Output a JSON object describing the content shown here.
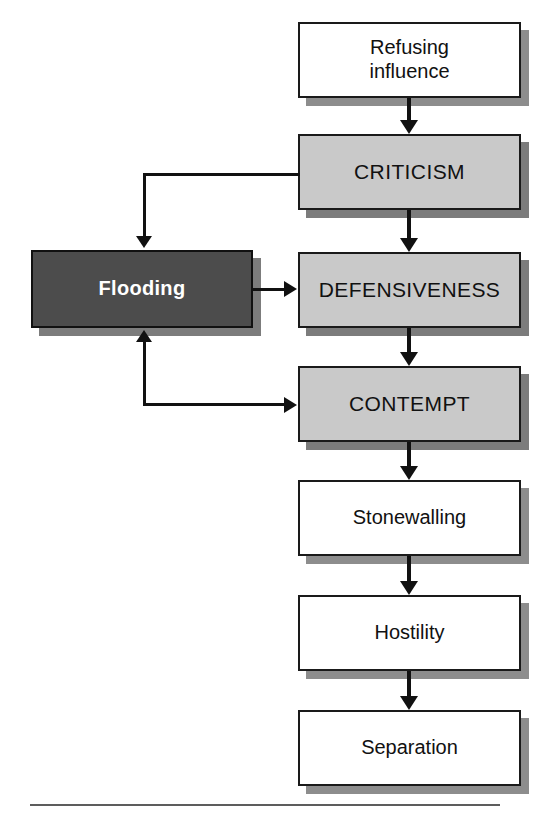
{
  "diagram": {
    "nodes": [
      {
        "id": "refusing-influence",
        "label": "Refusing\ninfluence",
        "style": "white",
        "x": 298,
        "y": 22,
        "w": 223,
        "h": 76
      },
      {
        "id": "criticism",
        "label": "CRITICISM",
        "style": "gray",
        "x": 298,
        "y": 134,
        "w": 223,
        "h": 76
      },
      {
        "id": "defensiveness",
        "label": "DEFENSIVENESS",
        "style": "gray",
        "x": 298,
        "y": 252,
        "w": 223,
        "h": 76
      },
      {
        "id": "contempt",
        "label": "CONTEMPT",
        "style": "gray",
        "x": 298,
        "y": 366,
        "w": 223,
        "h": 76
      },
      {
        "id": "stonewalling",
        "label": "Stonewalling",
        "style": "white",
        "x": 298,
        "y": 480,
        "w": 223,
        "h": 76
      },
      {
        "id": "hostility",
        "label": "Hostility",
        "style": "white",
        "x": 298,
        "y": 595,
        "w": 223,
        "h": 76
      },
      {
        "id": "separation",
        "label": "Separation",
        "style": "white",
        "x": 298,
        "y": 710,
        "w": 223,
        "h": 76
      },
      {
        "id": "flooding",
        "label": "Flooding",
        "style": "dark",
        "x": 31,
        "y": 250,
        "w": 222,
        "h": 78
      }
    ],
    "edges": [
      {
        "id": "refusing-to-criticism",
        "from": "refusing-influence",
        "to": "criticism",
        "kind": "down"
      },
      {
        "id": "criticism-to-defensiveness",
        "from": "criticism",
        "to": "defensiveness",
        "kind": "down"
      },
      {
        "id": "defensiveness-to-contempt",
        "from": "defensiveness",
        "to": "contempt",
        "kind": "down"
      },
      {
        "id": "contempt-to-stonewalling",
        "from": "contempt",
        "to": "stonewalling",
        "kind": "down"
      },
      {
        "id": "stonewalling-to-hostility",
        "from": "stonewalling",
        "to": "hostility",
        "kind": "down"
      },
      {
        "id": "hostility-to-separation",
        "from": "hostility",
        "to": "separation",
        "kind": "down"
      },
      {
        "id": "criticism-to-flooding",
        "from": "criticism",
        "to": "flooding",
        "kind": "elbow-left-down"
      },
      {
        "id": "flooding-to-defensiveness",
        "from": "flooding",
        "to": "defensiveness",
        "kind": "right"
      },
      {
        "id": "flooding-to-contempt",
        "from": "flooding",
        "to": "contempt",
        "kind": "elbow-down-right"
      }
    ],
    "colors": {
      "box_white_fill": "#ffffff",
      "box_gray_fill": "#c9c9c9",
      "box_dark_fill": "#4c4c4c",
      "box_dark_text": "#ffffff",
      "stroke": "#1a1a1a",
      "shadow": "#8d8d8d",
      "rule": "#5d5d5d",
      "background": "#ffffff"
    },
    "footer_rule": "horizontal-rule"
  }
}
